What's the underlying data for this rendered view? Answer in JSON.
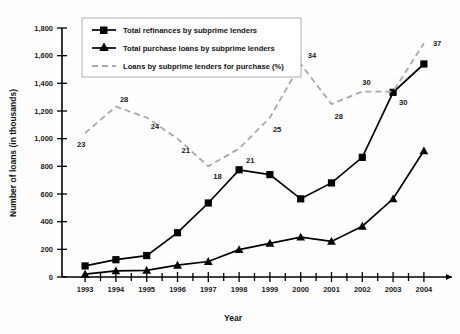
{
  "chart_data": {
    "type": "line",
    "title": "",
    "xlabel": "Year",
    "ylabel": "Number of loans (in thousands)",
    "categories": [
      "1993",
      "1994",
      "1995",
      "1996",
      "1997",
      "1998",
      "1999",
      "2000",
      "2001",
      "2002",
      "2003",
      "2004"
    ],
    "ylim": [
      0,
      1800
    ],
    "ytick_labels": [
      "0",
      "200",
      "400",
      "600",
      "800",
      "1,000",
      "1,200",
      "1,400",
      "1,600",
      "1,800"
    ],
    "ytick_values": [
      0,
      200,
      400,
      600,
      800,
      1000,
      1200,
      1400,
      1600,
      1800
    ],
    "grid": false,
    "legend_position": "top-left",
    "series": [
      {
        "name": "Total refinances by subprime lenders",
        "marker": "square",
        "style": "solid",
        "color": "#000000",
        "values": [
          80,
          125,
          155,
          320,
          535,
          775,
          740,
          565,
          680,
          865,
          1335,
          1540
        ]
      },
      {
        "name": "Total purchase loans by subprime lenders",
        "marker": "triangle",
        "style": "solid",
        "color": "#000000",
        "values": [
          20,
          45,
          48,
          85,
          112,
          198,
          243,
          288,
          257,
          367,
          565,
          912
        ]
      },
      {
        "name": "Loans by subprime lenders for purchase (%)",
        "marker": "none",
        "style": "dashed",
        "color": "#a8a8a8",
        "axis": "percent-overlay",
        "values": [
          23,
          28,
          24,
          21,
          18,
          21,
          25,
          34,
          28,
          30,
          30,
          37
        ],
        "plotted_y": [
          1040,
          1232,
          1152,
          1000,
          800,
          928,
          1152,
          1540,
          1250,
          1340,
          1340,
          1690
        ],
        "data_labels": [
          "23",
          "28",
          "24",
          "21",
          "18",
          "21",
          "25",
          "34",
          "28",
          "30",
          "30",
          "37"
        ]
      }
    ]
  },
  "axes": {
    "x_title": "Year",
    "y_title": "Number of loans (in thousands)"
  },
  "legend": {
    "items": [
      {
        "label": "Total refinances by subprime lenders",
        "marker": "square-marker",
        "style": "solid"
      },
      {
        "label": "Total purchase loans by subprime lenders",
        "marker": "triangle-marker",
        "style": "solid"
      },
      {
        "label": "Loans by subprime lenders for purchase (%)",
        "marker": "dashed-line",
        "style": "dashed"
      }
    ]
  },
  "colors": {
    "series_solid": "#000000",
    "series_dashed": "#a8a8a8",
    "axis": "#000000",
    "background": "#ffffff"
  }
}
